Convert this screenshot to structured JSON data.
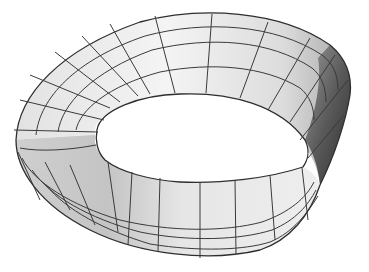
{
  "figure": {
    "style": "grayscale shaded surface with wireframe grid",
    "colors": {
      "background": "#ffffff",
      "surface_light": "#f2f2f2",
      "surface_mid": "#c8c8c8",
      "surface_dark": "#3c3c3c",
      "grid_line": "#3a3a3a"
    },
    "grid": {
      "strips_across_width": 4,
      "segments_along_length": 28
    }
  }
}
